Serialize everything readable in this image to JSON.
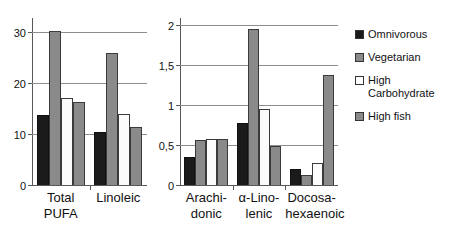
{
  "chart_data": {
    "type": "bar",
    "title": "",
    "subtitle": "",
    "xlabel": "",
    "grid": true,
    "legend_position": "right",
    "legend_entries": [
      "Omnivorous",
      "Vegetarian",
      "High Carbohydrate",
      "High fish"
    ],
    "series_colors": [
      "#1b1b1b",
      "#8a8a8a",
      "#ffffff",
      "#8a8a8a"
    ],
    "panels": [
      {
        "name": "left-panel",
        "ylabel": "",
        "ylim": [
          0,
          33
        ],
        "yticks": [
          0,
          10,
          20,
          30
        ],
        "ytick_labels": [
          "0",
          "10",
          "20",
          "30"
        ],
        "categories": [
          "Total\nPUFA",
          "Linoleic"
        ],
        "series": [
          {
            "name": "Omnivorous",
            "values": [
              13.8,
              10.5
            ]
          },
          {
            "name": "Vegetarian",
            "values": [
              30.2,
              26.0
            ]
          },
          {
            "name": "High Carbohydrate",
            "values": [
              17.0,
              14.0
            ]
          },
          {
            "name": "High fish",
            "values": [
              16.4,
              11.3
            ]
          }
        ]
      },
      {
        "name": "right-panel",
        "ylabel": "",
        "ylim": [
          0,
          2.1
        ],
        "yticks": [
          0,
          0.5,
          1,
          1.5,
          2
        ],
        "ytick_labels": [
          "0",
          "0,5",
          "1",
          "1,5",
          "2"
        ],
        "categories": [
          "Arachi-\ndonic",
          "α-Lino-\nlenic",
          "Docosa-\nhexaenoic"
        ],
        "series": [
          {
            "name": "Omnivorous",
            "values": [
              0.35,
              0.78,
              0.2
            ]
          },
          {
            "name": "Vegetarian",
            "values": [
              0.56,
              1.95,
              0.13
            ]
          },
          {
            "name": "High Carbohydrate",
            "values": [
              0.58,
              0.95,
              0.27
            ]
          },
          {
            "name": "High fish",
            "values": [
              0.58,
              0.49,
              1.38
            ]
          }
        ]
      }
    ]
  },
  "legend": {
    "items": [
      {
        "label": "Omnivorous",
        "color": "#1b1b1b"
      },
      {
        "label": "Vegetarian",
        "color": "#8a8a8a"
      },
      {
        "label": "High\nCarbohydrate",
        "color": "#ffffff"
      },
      {
        "label": "High fish",
        "color": "#8a8a8a"
      }
    ]
  }
}
